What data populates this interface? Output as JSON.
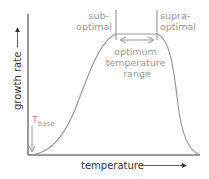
{
  "diagram": {
    "title": "",
    "y_axis_label": "growth rate",
    "x_axis_label": "temperature",
    "annotations": {
      "sub_optimal": [
        "sub-",
        "optimal"
      ],
      "supra_optimal": [
        "supra-",
        "optimal"
      ],
      "optimum_range": [
        "optimum",
        "temperature",
        "range"
      ],
      "t_base": {
        "main": "T",
        "subscript": "base"
      }
    },
    "colors": {
      "axis": "#333333",
      "curve": "#999999",
      "annotation": "#9a9a9a"
    }
  }
}
